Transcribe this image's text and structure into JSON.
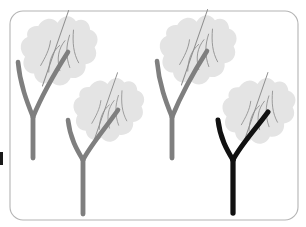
{
  "canvas": {
    "width": 306,
    "height": 227,
    "background": "#ffffff"
  },
  "card": {
    "label": "rounded-card",
    "x": 10,
    "y": 11,
    "width": 288,
    "height": 209,
    "radius": 13,
    "fill": "#ffffff",
    "stroke": "#b4b4b4",
    "stroke_width": 1.1
  },
  "edge_marker": {
    "label": "clipped-edge-sliver",
    "x": 0,
    "y": 152,
    "width": 3,
    "height": 13,
    "fill": "#1a1a1a"
  },
  "palette": {
    "stem_gray": "#7f7f7f",
    "stem_black": "#111111",
    "leaf_fill": "#e4e4e4",
    "vein_line": "#8e8e8e",
    "card_stroke": "#b4b4b4",
    "background": "#ffffff"
  },
  "figures": [
    {
      "id": "plant-1",
      "label": "plant-figure-top-left",
      "stem_color": "#7f7f7f",
      "stem_width": 4.6,
      "highlighted": false,
      "fork_x": 33,
      "fork_y": 117,
      "left_branch": "M 18,62 C 20,84 27,102 33,117",
      "right_branch": "M 68,52 C 54,74 40,100 33,117",
      "stem_base": "M 33,117 L 33,158",
      "leaf": {
        "cx": 55,
        "cy": 51,
        "rotation": -34,
        "scale": 1.0
      }
    },
    {
      "id": "plant-2",
      "label": "plant-figure-bottom-left",
      "stem_color": "#7f7f7f",
      "stem_width": 4.6,
      "highlighted": false,
      "fork_x": 83,
      "fork_y": 160,
      "left_branch": "M 68,120 C 70,138 77,150 83,160",
      "right_branch": "M 118,110 C 104,130 90,146 83,160",
      "stem_base": "M 83,160 L 83,214",
      "leaf": {
        "cx": 105,
        "cy": 110,
        "rotation": -34,
        "scale": 0.92
      }
    },
    {
      "id": "plant-3",
      "label": "plant-figure-top-right",
      "stem_color": "#7f7f7f",
      "stem_width": 4.6,
      "highlighted": false,
      "fork_x": 172,
      "fork_y": 117,
      "left_branch": "M 157,61 C 159,84 166,102 172,117",
      "right_branch": "M 207,51 C 193,73 179,100 172,117",
      "stem_base": "M 172,117 L 172,158",
      "leaf": {
        "cx": 194,
        "cy": 50,
        "rotation": -34,
        "scale": 1.0
      }
    },
    {
      "id": "plant-4",
      "label": "plant-figure-bottom-right",
      "stem_color": "#111111",
      "stem_width": 5.0,
      "highlighted": true,
      "fork_x": 233,
      "fork_y": 160,
      "left_branch": "M 218,120 C 220,138 227,150 233,160",
      "right_branch": "M 268,112 C 254,131 240,146 233,160",
      "stem_base": "M 233,160 L 233,213",
      "leaf": {
        "cx": 255,
        "cy": 111,
        "rotation": -34,
        "scale": 0.95
      }
    }
  ],
  "leaf_shape": {
    "label": "lobed-oak-leaf-blob",
    "blob_path": "M 0,-30 C 9,-34 17,-30 18,-22 C 26,-26 34,-22 34,-13 C 42,-12 45,-5 41,2 C 46,8 43,17 35,19 C 34,28 26,32 18,28 C 14,36 4,37 -2,31 C -10,36 -19,32 -20,23 C -29,23 -34,15 -30,7 C -37,2 -36,-8 -28,-12 C -30,-21 -23,-29 -15,-27 C -13,-33 -6,-35 0,-30 Z",
    "midrib_path": "M -30,22 L 34,-26",
    "vein_paths": [
      "M -17,14 C -10,4 -2,-1 7,-2",
      "M -7,19 C -3,7 4,0 14,-3",
      "M 3,22 C 6,10 12,2 21,-5",
      "M 13,23 C 14,12 19,3 27,-7",
      "M -20,4 C -12,0 -4,-4 2,-11"
    ]
  }
}
